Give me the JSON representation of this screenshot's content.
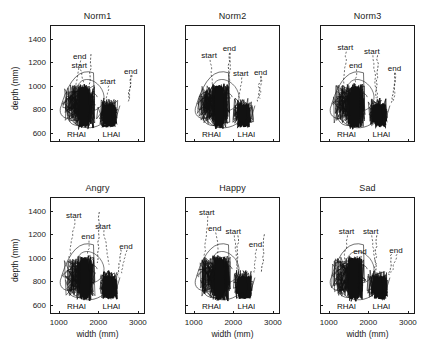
{
  "figure": {
    "rows": 2,
    "cols": 3,
    "shared_axes": {
      "ylabel": "depth (mm)",
      "xlabel": "width (mm)",
      "yticks": [
        600,
        800,
        1000,
        1200,
        1400
      ],
      "xticks": [
        1000,
        2000,
        3000
      ],
      "ylim": [
        520,
        1520
      ],
      "xlim": [
        780,
        3180
      ],
      "grid": false
    }
  },
  "chart_data": {
    "type": "line",
    "title": "",
    "xlabel": "width (mm)",
    "ylabel": "depth (mm)",
    "xlim": [
      780,
      3180
    ],
    "ylim": [
      520,
      1520
    ],
    "xticks": [
      1000,
      2000,
      3000
    ],
    "yticks": [
      600,
      800,
      1000,
      1200,
      1400
    ],
    "grid": false,
    "legend": "none",
    "marker_labels": [
      "RHAI",
      "LHAI"
    ],
    "annotations": [
      "start",
      "end"
    ],
    "panels": [
      {
        "title": "Norm1",
        "row": 0,
        "col": 0,
        "show_yticks": true,
        "show_xticks": false,
        "markers": [
          {
            "label": "RHAI",
            "x": 1450,
            "y": 590
          },
          {
            "label": "LHAI",
            "x": 2330,
            "y": 590
          }
        ],
        "annotations": [
          {
            "text": "end",
            "x": 1530,
            "y": 1255
          },
          {
            "text": "start",
            "x": 1520,
            "y": 1175
          },
          {
            "text": "start",
            "x": 2240,
            "y": 1040
          },
          {
            "text": "end",
            "x": 2820,
            "y": 1130
          }
        ],
        "leaders": [
          {
            "x1": 1530,
            "y1": 1225,
            "x2": 1360,
            "y2": 900
          },
          {
            "x1": 1520,
            "y1": 1148,
            "x2": 1700,
            "y2": 905
          },
          {
            "x1": 2240,
            "y1": 1010,
            "x2": 2180,
            "y2": 880
          },
          {
            "x1": 2820,
            "y1": 1100,
            "x2": 2760,
            "y2": 900
          }
        ],
        "right_tail": {
          "x": 2800,
          "y_top": 1100,
          "y_bot": 860
        },
        "mid_tail": {
          "x": 1790,
          "y_top": 1280,
          "y_bot": 900
        },
        "seed": 11
      },
      {
        "title": "Norm2",
        "row": 0,
        "col": 1,
        "show_yticks": false,
        "show_xticks": false,
        "markers": [
          {
            "label": "RHAI",
            "x": 1450,
            "y": 590
          },
          {
            "label": "LHAI",
            "x": 2330,
            "y": 590
          }
        ],
        "annotations": [
          {
            "text": "start",
            "x": 1390,
            "y": 1260
          },
          {
            "text": "end",
            "x": 1900,
            "y": 1320
          },
          {
            "text": "start",
            "x": 2190,
            "y": 1110
          },
          {
            "text": "end",
            "x": 2690,
            "y": 1120
          }
        ],
        "leaders": [
          {
            "x1": 1390,
            "y1": 1230,
            "x2": 1470,
            "y2": 980
          },
          {
            "x1": 1900,
            "y1": 1290,
            "x2": 1860,
            "y2": 960
          },
          {
            "x1": 2190,
            "y1": 1080,
            "x2": 2120,
            "y2": 900
          },
          {
            "x1": 2690,
            "y1": 1090,
            "x2": 2640,
            "y2": 900
          }
        ],
        "right_tail": {
          "x": 2660,
          "y_top": 1090,
          "y_bot": 870
        },
        "mid_tail": {
          "x": 1880,
          "y_top": 1290,
          "y_bot": 930
        },
        "seed": 22
      },
      {
        "title": "Norm3",
        "row": 0,
        "col": 2,
        "show_yticks": false,
        "show_xticks": false,
        "markers": [
          {
            "label": "RHAI",
            "x": 1450,
            "y": 590
          },
          {
            "label": "LHAI",
            "x": 2330,
            "y": 590
          }
        ],
        "annotations": [
          {
            "text": "start",
            "x": 1420,
            "y": 1330
          },
          {
            "text": "end",
            "x": 1680,
            "y": 1180
          },
          {
            "text": "start",
            "x": 2090,
            "y": 1300
          },
          {
            "text": "end",
            "x": 2660,
            "y": 1150
          }
        ],
        "leaders": [
          {
            "x1": 1420,
            "y1": 1300,
            "x2": 1330,
            "y2": 950
          },
          {
            "x1": 1680,
            "y1": 1150,
            "x2": 1600,
            "y2": 940
          },
          {
            "x1": 2090,
            "y1": 1270,
            "x2": 2200,
            "y2": 900
          },
          {
            "x1": 2660,
            "y1": 1120,
            "x2": 2620,
            "y2": 880
          }
        ],
        "right_tail": {
          "x": 2640,
          "y_top": 1120,
          "y_bot": 860
        },
        "mid_tail": {
          "x": 2210,
          "y_top": 1270,
          "y_bot": 900
        },
        "seed": 33
      },
      {
        "title": "Angry",
        "row": 1,
        "col": 0,
        "show_yticks": true,
        "show_xticks": true,
        "markers": [
          {
            "label": "RHAI",
            "x": 1450,
            "y": 590
          },
          {
            "label": "LHAI",
            "x": 2330,
            "y": 590
          }
        ],
        "annotations": [
          {
            "text": "start",
            "x": 1380,
            "y": 1370
          },
          {
            "text": "end",
            "x": 1740,
            "y": 1185
          },
          {
            "text": "start",
            "x": 2120,
            "y": 1275
          },
          {
            "text": "end",
            "x": 2700,
            "y": 1105
          }
        ],
        "leaders": [
          {
            "x1": 1380,
            "y1": 1340,
            "x2": 1230,
            "y2": 980
          },
          {
            "x1": 1740,
            "y1": 1155,
            "x2": 1700,
            "y2": 940
          },
          {
            "x1": 2120,
            "y1": 1245,
            "x2": 2230,
            "y2": 950
          },
          {
            "x1": 2700,
            "y1": 1075,
            "x2": 2560,
            "y2": 880
          }
        ],
        "right_tail": {
          "x": 2540,
          "y_top": 1080,
          "y_bot": 840
        },
        "mid_tail": {
          "x": 2000,
          "y_top": 1400,
          "y_bot": 960
        },
        "seed": 44
      },
      {
        "title": "Happy",
        "row": 1,
        "col": 1,
        "show_yticks": false,
        "show_xticks": true,
        "markers": [
          {
            "label": "RHAI",
            "x": 1450,
            "y": 590
          },
          {
            "label": "LHAI",
            "x": 2330,
            "y": 590
          }
        ],
        "annotations": [
          {
            "text": "start",
            "x": 1330,
            "y": 1395
          },
          {
            "text": "end",
            "x": 1530,
            "y": 1255
          },
          {
            "text": "start",
            "x": 2000,
            "y": 1230
          },
          {
            "text": "end",
            "x": 2560,
            "y": 1115
          }
        ],
        "leaders": [
          {
            "x1": 1330,
            "y1": 1365,
            "x2": 1230,
            "y2": 950
          },
          {
            "x1": 1530,
            "y1": 1225,
            "x2": 1640,
            "y2": 930
          },
          {
            "x1": 2000,
            "y1": 1200,
            "x2": 2100,
            "y2": 900
          },
          {
            "x1": 2560,
            "y1": 1085,
            "x2": 2500,
            "y2": 870
          }
        ],
        "right_tail": {
          "x": 2760,
          "y_top": 1210,
          "y_bot": 880
        },
        "mid_tail": {
          "x": 2090,
          "y_top": 1200,
          "y_bot": 900
        },
        "seed": 55
      },
      {
        "title": "Sad",
        "row": 1,
        "col": 2,
        "show_yticks": false,
        "show_xticks": true,
        "markers": [
          {
            "label": "RHAI",
            "x": 1450,
            "y": 590
          },
          {
            "label": "LHAI",
            "x": 2330,
            "y": 590
          }
        ],
        "annotations": [
          {
            "text": "start",
            "x": 1450,
            "y": 1230
          },
          {
            "text": "end",
            "x": 1790,
            "y": 1055
          },
          {
            "text": "start",
            "x": 2060,
            "y": 1230
          },
          {
            "text": "end",
            "x": 2700,
            "y": 1070
          }
        ],
        "leaders": [
          {
            "x1": 1450,
            "y1": 1200,
            "x2": 1350,
            "y2": 930
          },
          {
            "x1": 1790,
            "y1": 1025,
            "x2": 1730,
            "y2": 900
          },
          {
            "x1": 2060,
            "y1": 1200,
            "x2": 2180,
            "y2": 900
          },
          {
            "x1": 2700,
            "y1": 1040,
            "x2": 2560,
            "y2": 880
          }
        ],
        "right_tail": {
          "x": 2560,
          "y_top": 1040,
          "y_bot": 860
        },
        "mid_tail": {
          "x": 2190,
          "y_top": 1200,
          "y_bot": 900
        },
        "seed": 66
      }
    ]
  }
}
